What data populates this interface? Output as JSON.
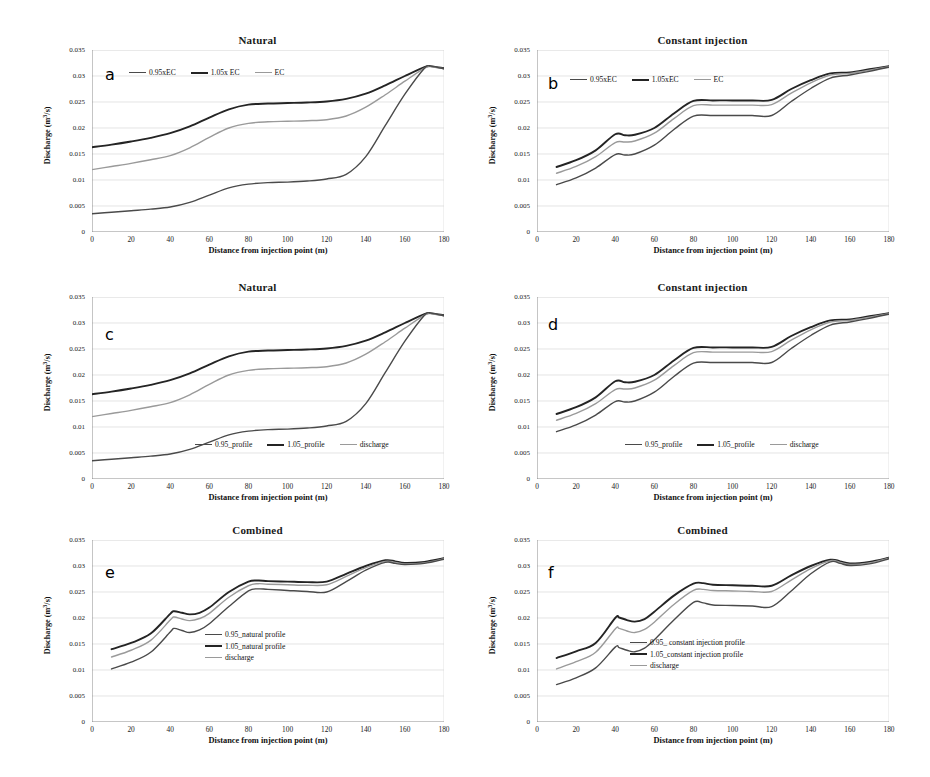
{
  "figure": {
    "axis": {
      "xlabel": "Distance from injection point (m)",
      "ylabel": "Discharge (m3/s)",
      "ylabel_unit_sup": "3",
      "xticks": [
        "0",
        "20",
        "40",
        "60",
        "80",
        "100",
        "120",
        "140",
        "160",
        "180"
      ],
      "yticks": [
        "0",
        "0.005",
        "0.01",
        "0.015",
        "0.02",
        "0.025",
        "0.03",
        "0.035"
      ],
      "xlim": [
        0,
        180
      ],
      "ylim": [
        0,
        0.035
      ]
    },
    "colors": {
      "series_light_gray": "#9a9a9a",
      "series_mid_gray": "#4a4a4a",
      "series_dark": "#242424",
      "gridline": "#d9d9d9",
      "axis": "#808080",
      "text": "#1a1a1a"
    }
  },
  "panels": [
    {
      "letter": "a",
      "title": "Natural",
      "legend_layout": "inline",
      "legend": [
        "0.95xEC",
        "1.05x EC",
        "EC"
      ]
    },
    {
      "letter": "b",
      "title": "Constant injection",
      "legend_layout": "inline",
      "legend": [
        "0.95xEC",
        "1.05xEC",
        "EC"
      ]
    },
    {
      "letter": "c",
      "title": "Natural",
      "legend_layout": "inline",
      "legend": [
        "0.95_profile",
        "1.05_profile",
        "discharge"
      ]
    },
    {
      "letter": "d",
      "title": "Constant injection",
      "legend_layout": "inline",
      "legend": [
        "0.95_profile",
        "1.05_profile",
        "discharge"
      ]
    },
    {
      "letter": "e",
      "title": "Combined",
      "legend_layout": "stacked",
      "legend": [
        "0.95_natural profile",
        "1.05_natural profile",
        "discharge"
      ]
    },
    {
      "letter": "f",
      "title": "Combined",
      "legend_layout": "stacked",
      "legend": [
        "0.95_ constant injection profile",
        "1.05_constant injection profile",
        "discharge"
      ]
    }
  ],
  "chart_data": [
    {
      "id": "a",
      "type": "line",
      "title": "Natural",
      "xlabel": "Distance from injection point (m)",
      "ylabel": "Discharge (m3/s)",
      "xlim": [
        0,
        180
      ],
      "ylim": [
        0,
        0.035
      ],
      "grid": true,
      "legend_position": "top-left-inline",
      "x": [
        0,
        10,
        20,
        30,
        40,
        50,
        60,
        70,
        80,
        90,
        100,
        110,
        120,
        130,
        140,
        150,
        160,
        170,
        173,
        176,
        180
      ],
      "series": [
        {
          "name": "1.05x EC",
          "color": "#242424",
          "values": [
            0.0163,
            0.0168,
            0.0174,
            0.0181,
            0.019,
            0.0203,
            0.022,
            0.0236,
            0.0245,
            0.0247,
            0.0248,
            0.0249,
            0.0251,
            0.0256,
            0.0266,
            0.0282,
            0.03,
            0.0317,
            0.0319,
            0.0317,
            0.0315
          ]
        },
        {
          "name": "EC",
          "color": "#9a9a9a",
          "values": [
            0.012,
            0.0126,
            0.0132,
            0.0139,
            0.0147,
            0.0162,
            0.0182,
            0.02,
            0.0209,
            0.0212,
            0.0213,
            0.0214,
            0.0216,
            0.0223,
            0.024,
            0.0264,
            0.029,
            0.0315,
            0.0318,
            0.0316,
            0.0314
          ]
        },
        {
          "name": "0.95xEC",
          "color": "#4a4a4a",
          "values": [
            0.0035,
            0.0038,
            0.0041,
            0.0044,
            0.0048,
            0.0057,
            0.0071,
            0.0085,
            0.0092,
            0.0095,
            0.0096,
            0.0098,
            0.0102,
            0.0111,
            0.0145,
            0.0205,
            0.0265,
            0.0315,
            0.0319,
            0.0317,
            0.0314
          ]
        }
      ]
    },
    {
      "id": "b",
      "type": "line",
      "title": "Constant injection",
      "xlabel": "Distance from injection point (m)",
      "ylabel": "Discharge (m3/s)",
      "xlim": [
        0,
        180
      ],
      "ylim": [
        0,
        0.035
      ],
      "grid": true,
      "legend_position": "top-left-inline",
      "x": [
        10,
        20,
        30,
        40,
        45,
        50,
        60,
        70,
        80,
        90,
        100,
        110,
        120,
        130,
        140,
        150,
        160,
        170,
        180
      ],
      "series": [
        {
          "name": "1.05xEC",
          "color": "#242424",
          "values": [
            0.0125,
            0.0138,
            0.0157,
            0.0188,
            0.0186,
            0.0187,
            0.02,
            0.0228,
            0.0252,
            0.0253,
            0.0253,
            0.0253,
            0.0254,
            0.0275,
            0.0292,
            0.0305,
            0.0307,
            0.0313,
            0.0319
          ]
        },
        {
          "name": "EC",
          "color": "#9a9a9a",
          "values": [
            0.0113,
            0.0126,
            0.0145,
            0.0172,
            0.0173,
            0.0175,
            0.019,
            0.0218,
            0.0243,
            0.0244,
            0.0244,
            0.0244,
            0.0245,
            0.0267,
            0.0287,
            0.0302,
            0.0305,
            0.0311,
            0.0318
          ]
        },
        {
          "name": "0.95xEC",
          "color": "#4a4a4a",
          "values": [
            0.0091,
            0.0104,
            0.0123,
            0.0149,
            0.0148,
            0.015,
            0.0167,
            0.0197,
            0.0223,
            0.0224,
            0.0224,
            0.0224,
            0.0224,
            0.0251,
            0.0276,
            0.0296,
            0.0302,
            0.0309,
            0.0317
          ]
        }
      ]
    },
    {
      "id": "c",
      "type": "line",
      "title": "Natural",
      "xlabel": "Distance from injection point (m)",
      "ylabel": "Discharge (m3/s)",
      "xlim": [
        0,
        180
      ],
      "ylim": [
        0,
        0.035
      ],
      "grid": true,
      "legend_position": "bottom-center-inline",
      "x": [
        0,
        10,
        20,
        30,
        40,
        50,
        60,
        70,
        80,
        90,
        100,
        110,
        120,
        130,
        140,
        150,
        160,
        170,
        173,
        176,
        180
      ],
      "series": [
        {
          "name": "1.05_profile",
          "color": "#242424",
          "values": [
            0.0163,
            0.0168,
            0.0174,
            0.0181,
            0.019,
            0.0203,
            0.022,
            0.0236,
            0.0245,
            0.0247,
            0.0248,
            0.0249,
            0.0251,
            0.0256,
            0.0266,
            0.0282,
            0.03,
            0.0317,
            0.0319,
            0.0317,
            0.0315
          ]
        },
        {
          "name": "discharge",
          "color": "#9a9a9a",
          "values": [
            0.012,
            0.0126,
            0.0132,
            0.0139,
            0.0147,
            0.0162,
            0.0182,
            0.02,
            0.0209,
            0.0212,
            0.0213,
            0.0214,
            0.0216,
            0.0223,
            0.024,
            0.0264,
            0.029,
            0.0315,
            0.0318,
            0.0316,
            0.0314
          ]
        },
        {
          "name": "0.95_profile",
          "color": "#4a4a4a",
          "values": [
            0.0035,
            0.0038,
            0.0041,
            0.0044,
            0.0048,
            0.0057,
            0.0071,
            0.0085,
            0.0092,
            0.0095,
            0.0096,
            0.0098,
            0.0102,
            0.0111,
            0.0145,
            0.0205,
            0.0265,
            0.0315,
            0.0319,
            0.0317,
            0.0314
          ]
        }
      ]
    },
    {
      "id": "d",
      "type": "line",
      "title": "Constant injection",
      "xlabel": "Distance from injection point (m)",
      "ylabel": "Discharge (m3/s)",
      "xlim": [
        0,
        180
      ],
      "ylim": [
        0,
        0.035
      ],
      "grid": true,
      "legend_position": "bottom-center-inline",
      "x": [
        10,
        20,
        30,
        40,
        45,
        50,
        60,
        70,
        80,
        90,
        100,
        110,
        120,
        130,
        140,
        150,
        160,
        170,
        180
      ],
      "series": [
        {
          "name": "1.05_profile",
          "color": "#242424",
          "values": [
            0.0125,
            0.0138,
            0.0157,
            0.0188,
            0.0186,
            0.0187,
            0.02,
            0.0228,
            0.0252,
            0.0253,
            0.0253,
            0.0253,
            0.0254,
            0.0275,
            0.0292,
            0.0305,
            0.0307,
            0.0313,
            0.0319
          ]
        },
        {
          "name": "discharge",
          "color": "#9a9a9a",
          "values": [
            0.0113,
            0.0126,
            0.0145,
            0.0172,
            0.0173,
            0.0175,
            0.019,
            0.0218,
            0.0243,
            0.0244,
            0.0244,
            0.0244,
            0.0245,
            0.0267,
            0.0287,
            0.0302,
            0.0305,
            0.0311,
            0.0318
          ]
        },
        {
          "name": "0.95_profile",
          "color": "#4a4a4a",
          "values": [
            0.0091,
            0.0104,
            0.0123,
            0.0149,
            0.0148,
            0.015,
            0.0167,
            0.0197,
            0.0223,
            0.0224,
            0.0224,
            0.0224,
            0.0224,
            0.0251,
            0.0276,
            0.0296,
            0.0302,
            0.0309,
            0.0317
          ]
        }
      ]
    },
    {
      "id": "e",
      "type": "line",
      "title": "Combined",
      "xlabel": "Distance from injection point (m)",
      "ylabel": "Discharge (m3/s)",
      "xlim": [
        0,
        180
      ],
      "ylim": [
        0,
        0.035
      ],
      "grid": true,
      "legend_position": "center-right-stacked",
      "x": [
        10,
        20,
        30,
        40,
        42,
        46,
        50,
        55,
        60,
        70,
        80,
        85,
        90,
        100,
        110,
        120,
        130,
        140,
        150,
        155,
        160,
        170,
        180
      ],
      "series": [
        {
          "name": "1.05_natural profile",
          "color": "#242424",
          "values": [
            0.014,
            0.0152,
            0.017,
            0.0208,
            0.0213,
            0.021,
            0.0207,
            0.021,
            0.022,
            0.025,
            0.027,
            0.0272,
            0.0271,
            0.027,
            0.0269,
            0.027,
            0.0285,
            0.03,
            0.0311,
            0.0309,
            0.0306,
            0.0308,
            0.0315
          ]
        },
        {
          "name": "discharge",
          "color": "#9a9a9a",
          "values": [
            0.0125,
            0.0138,
            0.0157,
            0.0196,
            0.0202,
            0.0198,
            0.0195,
            0.0199,
            0.0209,
            0.024,
            0.0262,
            0.0266,
            0.0265,
            0.0264,
            0.0263,
            0.0264,
            0.028,
            0.0297,
            0.0309,
            0.0307,
            0.0304,
            0.0306,
            0.0314
          ]
        },
        {
          "name": "0.95_natural profile",
          "color": "#4a4a4a",
          "values": [
            0.0102,
            0.0115,
            0.0134,
            0.0173,
            0.018,
            0.0176,
            0.0172,
            0.0177,
            0.0189,
            0.0222,
            0.0252,
            0.0256,
            0.0255,
            0.0253,
            0.0251,
            0.025,
            0.027,
            0.0292,
            0.0307,
            0.0305,
            0.0303,
            0.0305,
            0.0313
          ]
        }
      ]
    },
    {
      "id": "f",
      "type": "line",
      "title": "Combined",
      "xlabel": "Distance from injection point (m)",
      "ylabel": "Discharge (m3/s)",
      "xlim": [
        0,
        180
      ],
      "ylim": [
        0,
        0.035
      ],
      "grid": true,
      "legend_position": "center-right-stacked",
      "x": [
        10,
        20,
        30,
        40,
        42,
        46,
        50,
        55,
        60,
        70,
        80,
        85,
        90,
        100,
        110,
        120,
        130,
        140,
        150,
        155,
        160,
        170,
        180
      ],
      "series": [
        {
          "name": "1.05_constant injection profile",
          "color": "#242424",
          "values": [
            0.0123,
            0.0136,
            0.0152,
            0.02,
            0.0201,
            0.0196,
            0.0193,
            0.0198,
            0.0212,
            0.0243,
            0.0266,
            0.0267,
            0.0264,
            0.0263,
            0.0262,
            0.0262,
            0.0282,
            0.03,
            0.0312,
            0.0309,
            0.0305,
            0.0308,
            0.0316
          ]
        },
        {
          "name": "discharge",
          "color": "#9a9a9a",
          "values": [
            0.0102,
            0.0116,
            0.0134,
            0.0179,
            0.018,
            0.0175,
            0.0172,
            0.0178,
            0.0192,
            0.0226,
            0.0253,
            0.0255,
            0.0253,
            0.0252,
            0.0251,
            0.0251,
            0.0273,
            0.0295,
            0.031,
            0.0307,
            0.0303,
            0.0306,
            0.0315
          ]
        },
        {
          "name": "0.95_ constant injection profile",
          "color": "#4a4a4a",
          "values": [
            0.0072,
            0.0085,
            0.0104,
            0.0144,
            0.0143,
            0.0138,
            0.0135,
            0.0142,
            0.0158,
            0.0196,
            0.023,
            0.0229,
            0.0225,
            0.0224,
            0.0223,
            0.0222,
            0.0252,
            0.0285,
            0.0308,
            0.0305,
            0.0301,
            0.0304,
            0.0314
          ]
        }
      ]
    }
  ]
}
